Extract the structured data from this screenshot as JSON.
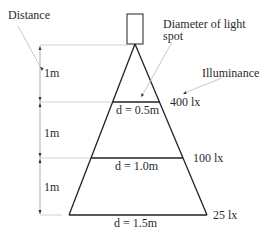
{
  "labels": {
    "distance": "Distance",
    "diameter_line1": "Diameter of light",
    "diameter_line2": "spot",
    "illuminance": "Illuminance"
  },
  "segments": [
    {
      "distance": "1m",
      "diameter": "d = 0.5m",
      "illuminance": "400 lx"
    },
    {
      "distance": "1m",
      "diameter": "d = 1.0m",
      "illuminance": "100 lx"
    },
    {
      "distance": "1m",
      "diameter": "d = 1.5m",
      "illuminance": "25 lx"
    }
  ],
  "colors": {
    "line": "#222222",
    "guide": "#bdbdbd",
    "text": "#2b2b2b"
  }
}
